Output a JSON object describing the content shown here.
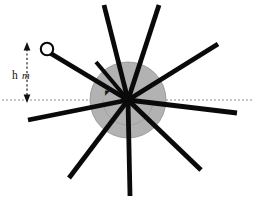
{
  "figure": {
    "title_visible": false,
    "background_color": "#ffffff",
    "hub": {
      "name": "wheel-hub-disc",
      "center_x": 128,
      "center_y": 100,
      "radius": 38,
      "fill_color": "#b2b2b2",
      "stroke_color": "#8e8e8e"
    },
    "inner_arc": {
      "name": "hub-inner-arc",
      "center_x": 128,
      "center_y": 100,
      "radius": 25,
      "stroke_color": "#9a9a9a"
    },
    "reference_axis": {
      "name": "horizontal-dashed-axis",
      "y": 100,
      "x_start": 0,
      "x_end": 255,
      "style": "dashed",
      "color": "#6f6f86"
    },
    "spokes": {
      "count": 10,
      "color": "#0a0a0a",
      "width": 4.6,
      "items": [
        {
          "label": "spoke-up-left",
          "angle_deg": 104,
          "length": 98
        },
        {
          "label": "spoke-up-right",
          "angle_deg": 72,
          "length": 100
        },
        {
          "label": "spoke-upper-right",
          "angle_deg": 32,
          "length": 106
        },
        {
          "label": "spoke-right",
          "angle_deg": -6,
          "length": 110
        },
        {
          "label": "spoke-lower-right",
          "angle_deg": -42,
          "length": 100
        },
        {
          "label": "spoke-down",
          "angle_deg": -90,
          "length": 100
        },
        {
          "label": "spoke-lower-left",
          "angle_deg": -128,
          "length": 92
        },
        {
          "label": "spoke-left",
          "angle_deg": 176,
          "length": 100
        },
        {
          "label": "spoke-upper-left-bob",
          "angle_deg": 151,
          "length": 92
        },
        {
          "label": "spoke-top-left-short",
          "angle_deg": 120,
          "length": 60
        }
      ]
    },
    "bob": {
      "name": "point-mass-ring",
      "cx": 47,
      "cy": 50,
      "r": 6.2,
      "fill_color": "#ffffff",
      "stroke_color": "#0a0a0a"
    },
    "dimension": {
      "name": "height-dimension",
      "x": 27,
      "y_top": 46,
      "y_bottom": 100,
      "label_symbol": "h",
      "label_unit": "m",
      "label_combined": "h m",
      "arrow_style": "double-headed",
      "color": "#111111"
    },
    "angle_marker": {
      "name": "angle-tick-mark",
      "x": 108,
      "y": 94,
      "symbol": "◤"
    }
  }
}
